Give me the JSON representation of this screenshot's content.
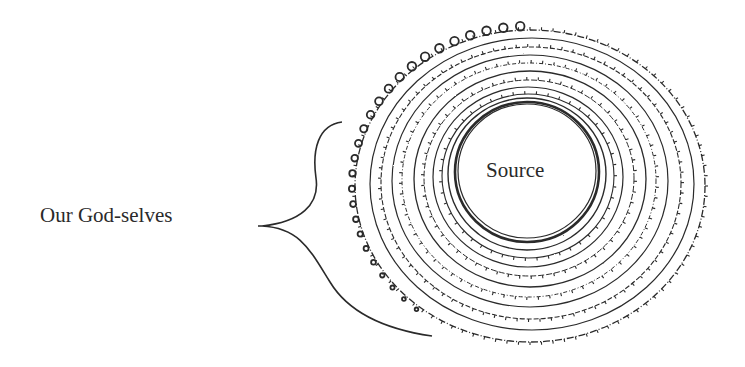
{
  "diagram": {
    "center_label": "Source",
    "bracket_label": "Our God-selves",
    "colors": {
      "background": "#ffffff",
      "ink": "#2a2a2a"
    },
    "spiral": {
      "center": [
        527,
        180
      ],
      "inner_radius": [
        72,
        70
      ],
      "outer_radius": [
        178,
        158
      ],
      "rings": 9
    }
  }
}
